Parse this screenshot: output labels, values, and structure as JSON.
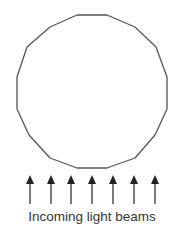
{
  "diagram": {
    "shape": {
      "type": "polygon",
      "description": "regular polygon approximating a circle (16 sides)",
      "stroke_color": "#555555",
      "fill_color": "#ffffff",
      "points": [
        [
          77,
          15
        ],
        [
          107,
          15
        ],
        [
          135,
          27
        ],
        [
          156,
          47
        ],
        [
          167,
          77
        ],
        [
          167,
          109
        ],
        [
          155,
          135
        ],
        [
          135,
          158
        ],
        [
          107,
          168
        ],
        [
          77,
          168
        ],
        [
          50,
          158
        ],
        [
          29,
          135
        ],
        [
          17,
          109
        ],
        [
          17,
          77
        ],
        [
          27,
          47
        ],
        [
          50,
          27
        ]
      ]
    },
    "arrows": {
      "count": 7,
      "direction": "up",
      "color": "#222222",
      "x_positions": [
        30,
        51,
        71,
        92,
        113,
        134,
        155
      ],
      "head_top_y": 175,
      "tail_y": 204
    },
    "caption": "Incoming light beams"
  }
}
